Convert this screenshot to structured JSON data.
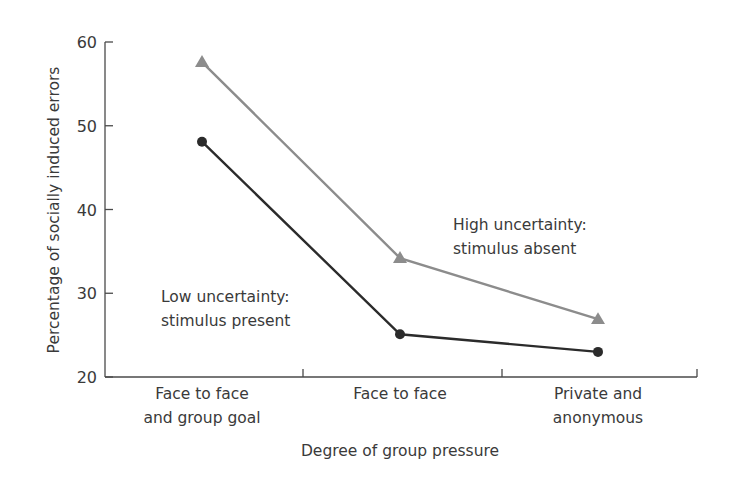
{
  "chart_data": {
    "type": "line",
    "title": "",
    "xlabel": "Degree of group pressure",
    "ylabel": "Percentage of socially induced errors",
    "ylim": [
      20,
      60
    ],
    "yticks": [
      20,
      30,
      40,
      50,
      60
    ],
    "categories": [
      [
        "Face to face",
        "and group goal"
      ],
      [
        "Face to face"
      ],
      [
        "Private and",
        "anonymous"
      ]
    ],
    "series": [
      {
        "name": "High uncertainty: stimulus absent",
        "label_lines": [
          "High uncertainty:",
          "stimulus absent"
        ],
        "marker": "triangle",
        "color": "#8c8c8c",
        "values": [
          57.6,
          34.2,
          26.9
        ]
      },
      {
        "name": "Low uncertainty: stimulus present",
        "label_lines": [
          "Low uncertainty:",
          "stimulus present"
        ],
        "marker": "circle",
        "color": "#2b2b2b",
        "values": [
          48.1,
          25.1,
          23.0
        ]
      }
    ],
    "grid": false,
    "legend": "inline annotations"
  }
}
